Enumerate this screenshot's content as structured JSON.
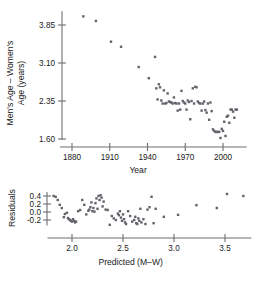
{
  "figure": {
    "name": "two-panel-regression-figure",
    "point_color": "#63636b",
    "axis_color": "#6e6e72"
  },
  "chart_data": [
    {
      "type": "scatter",
      "name": "marathon-age-gap-by-year",
      "title": "",
      "xlabel": "Year",
      "ylabel": "Men's Age – Women's Age (years)",
      "ylabel_line1": "Men's Age – Women's",
      "ylabel_line2": "Age (years)",
      "xticks": [
        1880,
        1910,
        1940,
        1970,
        2000
      ],
      "xticklabels": [
        "1880",
        "1910",
        "1940",
        "1970",
        "2000"
      ],
      "yticks": [
        3.85,
        3.1,
        2.35,
        1.6
      ],
      "yticklabels": [
        "3.85",
        "3.10",
        "2.35",
        "1.60"
      ],
      "xlim": [
        1872,
        2014
      ],
      "ylim": [
        1.48,
        4.15
      ],
      "grid": false,
      "legend": null,
      "x": [
        1889,
        1899,
        1911,
        1919,
        1933,
        1941,
        1946,
        1947,
        1948,
        1949,
        1950,
        1951,
        1952,
        1953,
        1954,
        1955,
        1956,
        1957,
        1958,
        1959,
        1960,
        1961,
        1962,
        1963,
        1964,
        1965,
        1966,
        1967,
        1968,
        1969,
        1970,
        1971,
        1972,
        1973,
        1974,
        1975,
        1976,
        1977,
        1978,
        1979,
        1980,
        1981,
        1982,
        1983,
        1984,
        1985,
        1986,
        1987,
        1988,
        1989,
        1990,
        1991,
        1992,
        1993,
        1994,
        1995,
        1996,
        1997,
        1998,
        1999,
        2000,
        2001,
        2002,
        2003,
        2004,
        2005,
        2006,
        2007,
        2008,
        2009,
        2010,
        2011
      ],
      "y": [
        4.02,
        3.93,
        3.52,
        3.42,
        3.02,
        2.8,
        3.22,
        2.6,
        2.38,
        2.68,
        2.62,
        2.36,
        2.3,
        2.56,
        2.3,
        2.31,
        2.5,
        2.34,
        2.33,
        2.32,
        2.3,
        2.42,
        2.31,
        2.3,
        2.16,
        2.3,
        2.18,
        2.55,
        2.35,
        2.32,
        2.3,
        2.18,
        2.36,
        2.33,
        1.99,
        2.35,
        2.6,
        2.3,
        2.63,
        2.62,
        2.34,
        2.31,
        2.3,
        2.16,
        2.3,
        2.34,
        2.17,
        2.12,
        2.3,
        1.98,
        2.32,
        2.15,
        1.79,
        1.76,
        1.74,
        1.74,
        1.74,
        1.74,
        1.62,
        1.8,
        1.76,
        1.94,
        1.66,
        2.04,
        2.06,
        1.92,
        2.18,
        2.18,
        2.14,
        2.02,
        2.18,
        2.18
      ]
    },
    {
      "type": "scatter",
      "name": "residuals-vs-predicted",
      "title": "",
      "xlabel": "Predicted (M–W)",
      "ylabel": "Residuals",
      "xticks": [
        2.0,
        2.5,
        3.0,
        3.5
      ],
      "xticklabels": [
        "2.0",
        "2.5",
        "3.0",
        "3.5"
      ],
      "yticks": [
        0.4,
        0.2,
        0.0,
        -0.2
      ],
      "yticklabels": [
        "0.4",
        "0.2",
        "0.0",
        "-0.2"
      ],
      "xlim": [
        1.78,
        3.72
      ],
      "ylim": [
        -0.42,
        0.52
      ],
      "grid": false,
      "legend": null,
      "x": [
        1.82,
        1.84,
        1.86,
        1.88,
        1.9,
        1.92,
        1.93,
        1.95,
        1.96,
        1.97,
        1.98,
        1.99,
        2.0,
        2.01,
        2.02,
        2.03,
        2.04,
        2.06,
        2.08,
        2.1,
        2.12,
        2.14,
        2.16,
        2.17,
        2.18,
        2.19,
        2.2,
        2.21,
        2.22,
        2.23,
        2.24,
        2.25,
        2.26,
        2.27,
        2.28,
        2.29,
        2.3,
        2.31,
        2.33,
        2.35,
        2.37,
        2.39,
        2.41,
        2.43,
        2.45,
        2.46,
        2.47,
        2.48,
        2.49,
        2.5,
        2.51,
        2.52,
        2.53,
        2.55,
        2.57,
        2.59,
        2.61,
        2.62,
        2.63,
        2.64,
        2.65,
        2.66,
        2.67,
        2.68,
        2.7,
        2.72,
        2.74,
        2.76,
        2.78,
        2.8,
        2.82,
        2.9,
        3.04,
        3.22,
        3.42,
        3.52,
        3.68
      ],
      "y": [
        0.4,
        0.38,
        0.3,
        0.18,
        0.1,
        -0.13,
        -0.05,
        -0.02,
        -0.15,
        -0.18,
        -0.2,
        -0.22,
        -0.24,
        -0.18,
        -0.22,
        -0.26,
        -0.24,
        0.02,
        0.05,
        0.3,
        0.18,
        -0.06,
        0.03,
        0.06,
        0.12,
        0.24,
        0.02,
        0.1,
        0.01,
        0.22,
        0.34,
        0.08,
        0.4,
        0.3,
        0.42,
        0.36,
        0.14,
        0.26,
        0.06,
        0.05,
        -0.32,
        -0.1,
        -0.16,
        -0.2,
        -0.04,
        -0.08,
        0.02,
        -0.14,
        -0.22,
        -0.06,
        -0.18,
        -0.26,
        -0.3,
        0.02,
        -0.1,
        -0.24,
        -0.2,
        -0.12,
        -0.28,
        -0.3,
        -0.16,
        -0.22,
        0.08,
        -0.26,
        -0.18,
        -0.3,
        0.06,
        0.12,
        0.38,
        -0.28,
        0.08,
        -0.12,
        -0.07,
        0.17,
        0.1,
        0.45,
        0.4
      ]
    }
  ]
}
